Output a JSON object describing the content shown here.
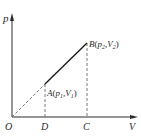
{
  "diagram": {
    "type": "p-V diagram",
    "axes": {
      "y_label": "p",
      "x_label": "V",
      "origin_label": "O"
    },
    "points": {
      "A": {
        "name": "A",
        "p_symbol": "p",
        "p_sub": "1",
        "v_symbol": "V",
        "v_sub": "1"
      },
      "B": {
        "name": "B",
        "p_symbol": "p",
        "p_sub": "2",
        "v_symbol": "V",
        "v_sub": "2"
      }
    },
    "foot_labels": {
      "D": "D",
      "C": "C"
    },
    "segments": [
      {
        "from": "O",
        "to": "A",
        "style": "dashed"
      },
      {
        "from": "A",
        "to": "B",
        "style": "solid"
      },
      {
        "from": "A",
        "to": "D",
        "style": "dashed"
      },
      {
        "from": "B",
        "to": "C",
        "style": "dashed"
      }
    ],
    "colors": {
      "ink": "#2a2a2a",
      "dashed": "#555555"
    }
  }
}
